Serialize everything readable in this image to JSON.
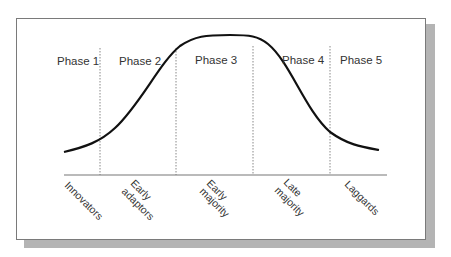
{
  "diagram": {
    "title": "",
    "phases": [
      {
        "label": "Phase 1"
      },
      {
        "label": "Phase 2"
      },
      {
        "label": "Phase 3"
      },
      {
        "label": "Phase 4"
      },
      {
        "label": "Phase 5"
      }
    ],
    "categories": [
      {
        "line1": "Innovators",
        "line2": ""
      },
      {
        "line1": "Early",
        "line2": "adaptors"
      },
      {
        "line1": "Early",
        "line2": "majority"
      },
      {
        "line1": "Late",
        "line2": "majority"
      },
      {
        "line1": "Laggards",
        "line2": ""
      }
    ],
    "curve": "bell-shaped adoption curve",
    "colors": {
      "curve": "#111111",
      "divider": "#777777",
      "axis": "#666666",
      "shadow": "#b4b4b4"
    }
  }
}
